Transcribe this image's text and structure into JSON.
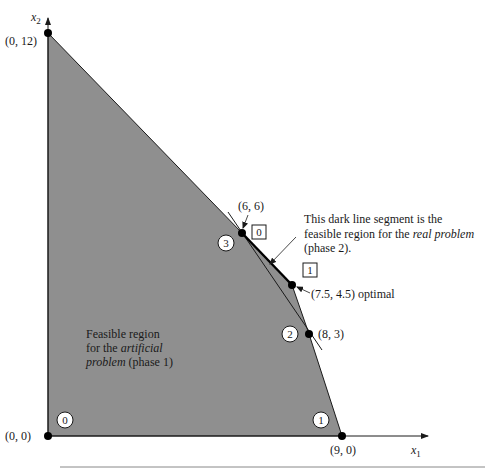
{
  "colors": {
    "region_fill": "#8f8f8f",
    "line": "#1a1a1a",
    "background": "#ffffff"
  },
  "axes": {
    "x_label": "x",
    "x_sub": "1",
    "y_label": "x",
    "y_sub": "2"
  },
  "points": [
    {
      "id": "origin",
      "label": "(0, 0)",
      "x": 0,
      "y": 0
    },
    {
      "id": "y-intercept",
      "label": "(0, 12)",
      "x": 0,
      "y": 12
    },
    {
      "id": "corner-6-6",
      "label": "(6, 6)",
      "x": 6,
      "y": 6
    },
    {
      "id": "optimal",
      "label": "(7.5, 4.5) optimal",
      "x": 7.5,
      "y": 4.5
    },
    {
      "id": "corner-8-3",
      "label": "(8, 3)",
      "x": 8,
      "y": 3
    },
    {
      "id": "x-intercept",
      "label": "(9, 0)",
      "x": 9,
      "y": 0
    }
  ],
  "circled_markers": [
    {
      "label": "0",
      "at": "(0, 0)"
    },
    {
      "label": "1",
      "at": "(9, 0)"
    },
    {
      "label": "2",
      "at": "(8, 3)"
    },
    {
      "label": "3",
      "at": "(6, 6)"
    }
  ],
  "boxed_markers": [
    {
      "label": "0",
      "at": "(6, 6)"
    },
    {
      "label": "1",
      "at": "(7.5, 4.5)"
    }
  ],
  "annotations": {
    "phase2": {
      "line1": "This dark line segment is the",
      "line2_prefix": "feasible region for the ",
      "line2_italic": "real problem",
      "line3": "(phase 2)."
    },
    "phase1": {
      "line1": "Feasible region",
      "line2_prefix": "for the ",
      "line2_italic": "artificial",
      "line3_italic": "problem",
      "line3_suffix": " (phase 1)"
    }
  }
}
